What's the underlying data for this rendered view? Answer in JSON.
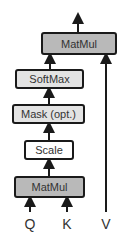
{
  "diagram": {
    "nodes": [
      {
        "id": "matmul_top",
        "label": "MatMul"
      },
      {
        "id": "softmax",
        "label": "SoftMax"
      },
      {
        "id": "mask",
        "label": "Mask (opt.)"
      },
      {
        "id": "scale",
        "label": "Scale"
      },
      {
        "id": "matmul_bottom",
        "label": "MatMul"
      }
    ],
    "inputs": [
      {
        "id": "q",
        "label": "Q"
      },
      {
        "id": "k",
        "label": "K"
      },
      {
        "id": "v",
        "label": "V"
      }
    ],
    "edges": [
      [
        "q",
        "matmul_bottom"
      ],
      [
        "k",
        "matmul_bottom"
      ],
      [
        "matmul_bottom",
        "scale"
      ],
      [
        "scale",
        "mask"
      ],
      [
        "mask",
        "softmax"
      ],
      [
        "softmax",
        "matmul_top"
      ],
      [
        "v",
        "matmul_top"
      ],
      [
        "matmul_top",
        "output"
      ]
    ],
    "colors": {
      "matmul": "#b9b9b9",
      "softmax": "#e3e3e3",
      "mask": "#e3e3e3",
      "scale": "#ffffff",
      "stroke": "#1a1a1a"
    }
  }
}
